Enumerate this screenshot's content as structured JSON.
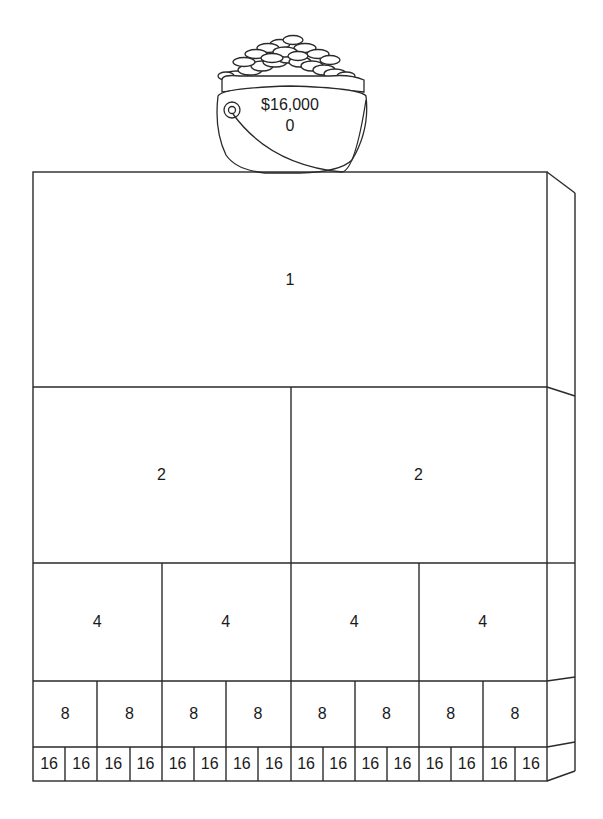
{
  "pot": {
    "amount": "$16,000",
    "level": "0"
  },
  "rows": [
    {
      "level": 0,
      "label": "1",
      "count": 1,
      "top": 172,
      "bottom": 387
    },
    {
      "level": 1,
      "label": "2",
      "count": 2,
      "top": 387,
      "bottom": 563
    },
    {
      "level": 2,
      "label": "4",
      "count": 4,
      "top": 563,
      "bottom": 681
    },
    {
      "level": 3,
      "label": "8",
      "count": 8,
      "top": 681,
      "bottom": 747
    },
    {
      "level": 4,
      "label": "16",
      "count": 16,
      "top": 747,
      "bottom": 781
    }
  ],
  "colors": {
    "line": "#2a2a2a",
    "background": "#ffffff"
  }
}
